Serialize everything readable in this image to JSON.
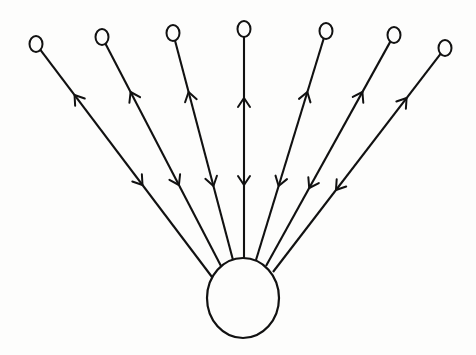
{
  "diagram": {
    "type": "star-graph",
    "background": "#fdfdfc",
    "stroke_color": "#111111",
    "hub": {
      "id": "hub",
      "cx": 243,
      "cy": 298,
      "rx": 36,
      "ry": 40
    },
    "leaves": [
      {
        "id": "leaf-1",
        "cx": 36,
        "cy": 44,
        "r": 7,
        "attach": [
          212,
          277
        ],
        "out_arrow_y": 95,
        "in_arrow_y": 185
      },
      {
        "id": "leaf-2",
        "cx": 102,
        "cy": 37,
        "r": 7,
        "attach": [
          221,
          266
        ],
        "out_arrow_y": 92,
        "in_arrow_y": 185
      },
      {
        "id": "leaf-3",
        "cx": 173,
        "cy": 33,
        "r": 7,
        "attach": [
          233,
          260
        ],
        "out_arrow_y": 92,
        "in_arrow_y": 186
      },
      {
        "id": "leaf-4",
        "cx": 244,
        "cy": 29,
        "r": 7,
        "attach": [
          244,
          258
        ],
        "out_arrow_y": 98,
        "in_arrow_y": 185
      },
      {
        "id": "leaf-5",
        "cx": 326,
        "cy": 31,
        "r": 7,
        "attach": [
          256,
          260
        ],
        "out_arrow_y": 92,
        "in_arrow_y": 186
      },
      {
        "id": "leaf-6",
        "cx": 394,
        "cy": 35,
        "r": 7,
        "attach": [
          266,
          266
        ],
        "out_arrow_y": 92,
        "in_arrow_y": 188
      },
      {
        "id": "leaf-7",
        "cx": 445,
        "cy": 48,
        "r": 7,
        "attach": [
          273,
          272
        ],
        "out_arrow_y": 98,
        "in_arrow_y": 190
      }
    ]
  }
}
